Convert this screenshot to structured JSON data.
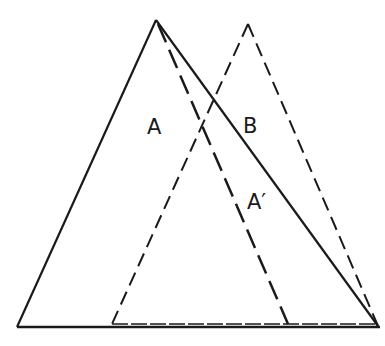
{
  "diagram": {
    "labels": {
      "a": "A",
      "b": "B",
      "a_prime": "A′"
    },
    "colors": {
      "stroke": "#1a1a1a",
      "background": "#ffffff"
    },
    "shapes": {
      "triangle_a": {
        "style": "solid",
        "points": [
          [
            156,
            20
          ],
          [
            17,
            327
          ],
          [
            378,
            326
          ]
        ]
      },
      "triangle_b": {
        "style": "dashed",
        "points": [
          [
            248,
            24
          ],
          [
            112,
            324
          ],
          [
            378,
            326
          ]
        ]
      },
      "triangle_a_prime": {
        "style": "dashed",
        "points": [
          [
            156,
            20
          ],
          [
            112,
            324
          ],
          [
            288,
            324
          ]
        ]
      }
    }
  }
}
